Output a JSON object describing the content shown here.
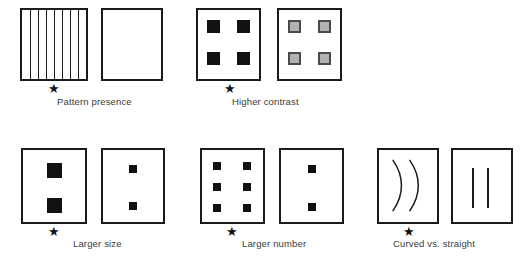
{
  "figure": {
    "groups": [
      {
        "id": "pattern-presence",
        "caption": "Pattern presence",
        "star_on": "left",
        "left": {
          "type": "stripes",
          "stripe_count": 7,
          "description": "box filled with vertical stripes"
        },
        "right": {
          "type": "empty",
          "description": "plain empty box"
        }
      },
      {
        "id": "higher-contrast",
        "caption": "Higher contrast",
        "star_on": "left",
        "left": {
          "type": "squares",
          "count": 4,
          "fill": "#111111",
          "description": "four black squares"
        },
        "right": {
          "type": "squares",
          "count": 4,
          "fill": "#b2b2b2",
          "stroke": "#4a4a4a",
          "description": "four gray squares"
        }
      },
      {
        "id": "larger-size",
        "caption": "Larger size",
        "star_on": "left",
        "left": {
          "type": "squares",
          "count": 2,
          "size": "large",
          "fill": "#111111",
          "description": "two large black squares"
        },
        "right": {
          "type": "squares",
          "count": 2,
          "size": "small",
          "fill": "#111111",
          "description": "two small black squares"
        }
      },
      {
        "id": "larger-number",
        "caption": "Larger number",
        "star_on": "left",
        "left": {
          "type": "squares",
          "count": 6,
          "size": "small",
          "fill": "#111111",
          "description": "six small black squares"
        },
        "right": {
          "type": "squares",
          "count": 2,
          "size": "small",
          "fill": "#111111",
          "description": "two small black squares"
        }
      },
      {
        "id": "curved-vs-straight",
        "caption": "Curved vs. straight",
        "star_on": "left",
        "left": {
          "type": "arcs",
          "count": 2,
          "description": "two curved arcs"
        },
        "right": {
          "type": "lines",
          "count": 2,
          "description": "two straight vertical lines"
        }
      }
    ],
    "star_glyph": "★",
    "colors": {
      "ink": "#1a1a1a",
      "fill_black": "#111111",
      "fill_gray": "#b2b2b2",
      "gray_stroke": "#4a4a4a",
      "paper": "#ffffff",
      "caption_text": "#3a3a3a"
    }
  }
}
